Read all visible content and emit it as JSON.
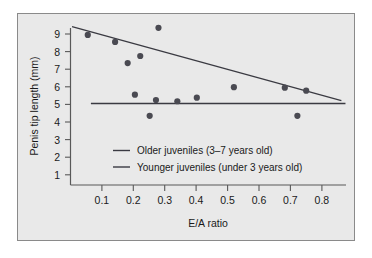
{
  "chart_data": {
    "type": "scatter",
    "title": "",
    "xlabel": "E/A ratio",
    "ylabel": "Penis tip length (mm)",
    "xlim": [
      0.0,
      0.875
    ],
    "ylim": [
      0.5,
      9.8
    ],
    "xticks": [
      0.1,
      0.2,
      0.3,
      0.4,
      0.5,
      0.6,
      0.7,
      0.8
    ],
    "xticklabels": [
      "0.1",
      "0.2",
      "0.3",
      "0.4",
      "0.5",
      "0.6",
      "0.7",
      "0.8"
    ],
    "yticks": [
      1,
      2,
      3,
      4,
      5,
      6,
      7,
      8,
      9
    ],
    "yticklabels": [
      "1",
      "2",
      "3",
      "4",
      "5",
      "6",
      "7",
      "8",
      "9"
    ],
    "grid": false,
    "legend_position": "inside-lower-center",
    "points": [
      {
        "x": 0.055,
        "y": 8.95
      },
      {
        "x": 0.142,
        "y": 8.55
      },
      {
        "x": 0.182,
        "y": 7.35
      },
      {
        "x": 0.205,
        "y": 5.55
      },
      {
        "x": 0.222,
        "y": 7.75
      },
      {
        "x": 0.252,
        "y": 4.35
      },
      {
        "x": 0.272,
        "y": 5.25
      },
      {
        "x": 0.28,
        "y": 9.35
      },
      {
        "x": 0.34,
        "y": 5.18
      },
      {
        "x": 0.402,
        "y": 5.38
      },
      {
        "x": 0.52,
        "y": 5.98
      },
      {
        "x": 0.682,
        "y": 5.95
      },
      {
        "x": 0.722,
        "y": 4.35
      },
      {
        "x": 0.75,
        "y": 5.78
      }
    ],
    "series": [
      {
        "name": "Older juveniles (3–7 years old)",
        "type": "line",
        "x": [
          0.005,
          0.862
        ],
        "y": [
          9.42,
          5.22
        ]
      },
      {
        "name": "Younger juveniles (under 3 years old)",
        "type": "line",
        "x": [
          0.065,
          0.875
        ],
        "y": [
          5.05,
          5.05
        ]
      }
    ]
  },
  "legend": {
    "items": [
      {
        "label": "Older juveniles (3–7 years old)"
      },
      {
        "label": "Younger juveniles (under 3 years old)"
      }
    ]
  },
  "colors": {
    "panel_background": "#e9e9e9",
    "point_color": "#4a4a52",
    "line_color": "#3a3a42",
    "axis_color": "#595959",
    "text_color": "#1a1a1a"
  }
}
